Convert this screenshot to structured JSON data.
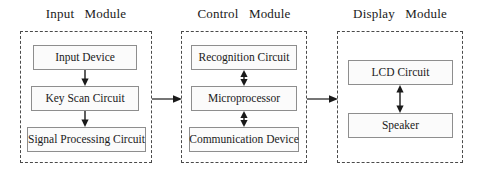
{
  "diagram": {
    "title_style": "block-diagram",
    "modules": [
      {
        "id": "input",
        "title": "Input   Module",
        "blocks": [
          {
            "id": "input-device",
            "label": "Input Device"
          },
          {
            "id": "key-scan-circuit",
            "label": "Key Scan Circuit"
          },
          {
            "id": "signal-processing-circuit",
            "label": "Signal Processing Circuit"
          }
        ],
        "internal_arrows": [
          {
            "from": "input-device",
            "to": "key-scan-circuit",
            "direction": "down"
          },
          {
            "from": "key-scan-circuit",
            "to": "signal-processing-circuit",
            "direction": "down"
          }
        ]
      },
      {
        "id": "control",
        "title": "Control   Module",
        "blocks": [
          {
            "id": "recognition-circuit",
            "label": "Recognition Circuit"
          },
          {
            "id": "microprocessor",
            "label": "Microprocessor"
          },
          {
            "id": "communication-device",
            "label": "Communication Device"
          }
        ],
        "internal_arrows": [
          {
            "from": "recognition-circuit",
            "to": "microprocessor",
            "direction": "both"
          },
          {
            "from": "microprocessor",
            "to": "communication-device",
            "direction": "both"
          }
        ]
      },
      {
        "id": "display",
        "title": "Display   Module",
        "blocks": [
          {
            "id": "lcd-circuit",
            "label": "LCD Circuit"
          },
          {
            "id": "speaker",
            "label": "Speaker"
          }
        ],
        "internal_arrows": [
          {
            "from": "lcd-circuit",
            "to": "speaker",
            "direction": "both"
          }
        ]
      }
    ],
    "module_links": [
      {
        "id": "input-to-control",
        "from": "input",
        "to": "control",
        "direction": "right"
      },
      {
        "id": "control-to-display",
        "from": "control",
        "to": "display",
        "direction": "right"
      }
    ],
    "colors": {
      "module_border": "#4a4a4a",
      "block_border": "#8e8e8e",
      "block_fill": "#fbfbfb",
      "text": "#1a1a1a",
      "arrow": "#1a1a1a",
      "background": "#ffffff"
    }
  }
}
